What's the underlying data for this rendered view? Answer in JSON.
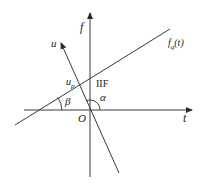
{
  "diagram": {
    "type": "coordinate-geometry",
    "axes": {
      "horizontal": {
        "label": "t"
      },
      "vertical": {
        "label": "f"
      },
      "origin_label": "O"
    },
    "lines": [
      {
        "id": "fq-line",
        "label_main": "f",
        "label_sub": "q",
        "label_arg": "(t)"
      },
      {
        "id": "u-line",
        "label": "u"
      }
    ],
    "points": [
      {
        "id": "intersection",
        "label_main": "u",
        "label_sub": "p"
      }
    ],
    "annotations": {
      "iif": "IIF",
      "alpha": "α",
      "beta": "β"
    },
    "colors": {
      "line": "#3a3a3a",
      "text": "#222222",
      "background": "#ffffff"
    }
  }
}
